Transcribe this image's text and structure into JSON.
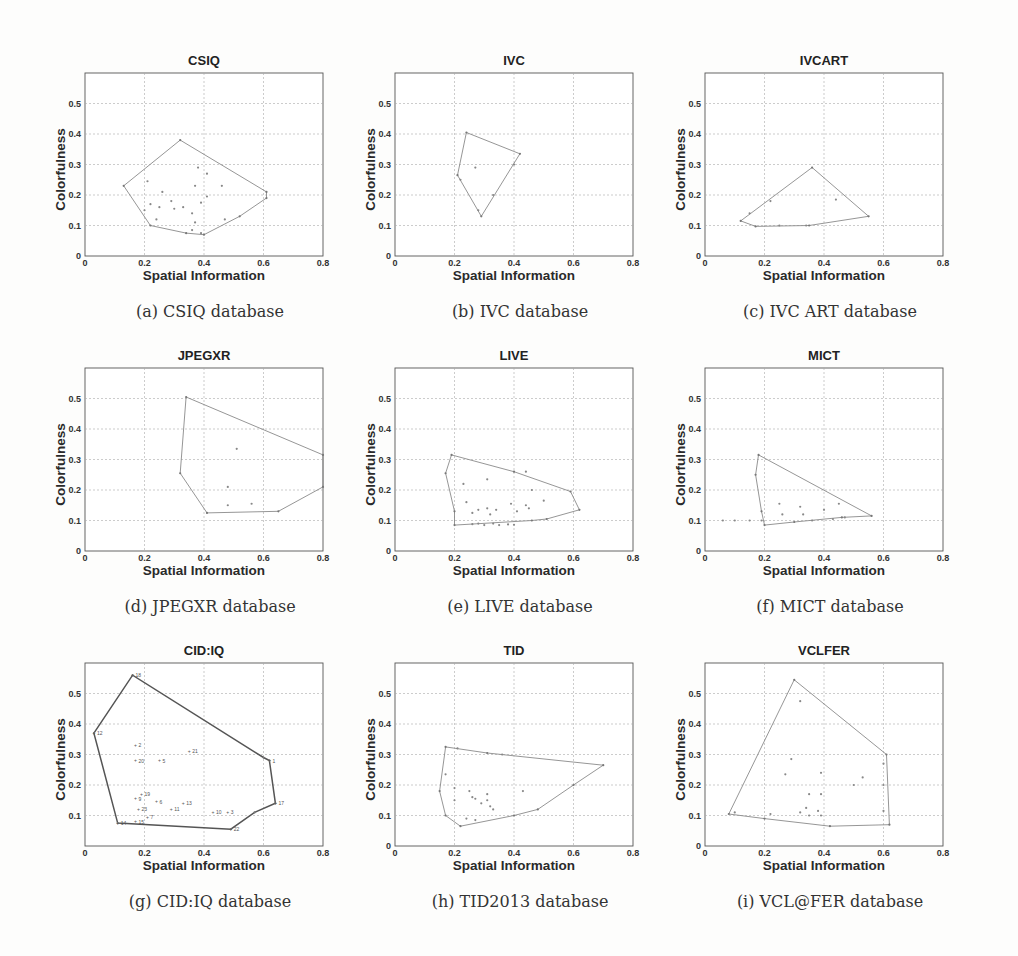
{
  "figure": {
    "panels": [
      {
        "id": "a",
        "caption": "(a)  CSIQ database"
      },
      {
        "id": "b",
        "caption": "(b)  IVC database"
      },
      {
        "id": "c",
        "caption": "(c)  IVC ART database"
      },
      {
        "id": "d",
        "caption": "(d)  JPEGXR database"
      },
      {
        "id": "e",
        "caption": "(e)  LIVE database"
      },
      {
        "id": "f",
        "caption": "(f)  MICT database"
      },
      {
        "id": "g",
        "caption": "(g)  CID:IQ database"
      },
      {
        "id": "h",
        "caption": "(h)  TID2013 database"
      },
      {
        "id": "i",
        "caption": "(i)  VCL@FER database"
      }
    ]
  },
  "chart_data": [
    {
      "type": "scatter",
      "title": "CSIQ",
      "xlabel": "Spatial Information",
      "ylabel": "Colorfulness",
      "xlim": [
        0,
        0.8
      ],
      "ylim": [
        0,
        0.6
      ],
      "xticks": [
        0,
        0.2,
        0.4,
        0.6,
        0.8
      ],
      "yticks": [
        0,
        0.1,
        0.2,
        0.3,
        0.4,
        0.5
      ],
      "grid": true,
      "hull": [
        [
          0.13,
          0.23
        ],
        [
          0.32,
          0.38
        ],
        [
          0.61,
          0.21
        ],
        [
          0.61,
          0.19
        ],
        [
          0.52,
          0.13
        ],
        [
          0.4,
          0.07
        ],
        [
          0.34,
          0.075
        ],
        [
          0.22,
          0.1
        ]
      ],
      "points": [
        [
          0.21,
          0.245
        ],
        [
          0.2,
          0.15
        ],
        [
          0.22,
          0.17
        ],
        [
          0.24,
          0.12
        ],
        [
          0.25,
          0.16
        ],
        [
          0.26,
          0.21
        ],
        [
          0.29,
          0.18
        ],
        [
          0.3,
          0.155
        ],
        [
          0.33,
          0.16
        ],
        [
          0.36,
          0.14
        ],
        [
          0.37,
          0.23
        ],
        [
          0.37,
          0.11
        ],
        [
          0.38,
          0.29
        ],
        [
          0.39,
          0.175
        ],
        [
          0.41,
          0.195
        ],
        [
          0.41,
          0.27
        ],
        [
          0.46,
          0.23
        ],
        [
          0.47,
          0.12
        ],
        [
          0.36,
          0.085
        ],
        [
          0.39,
          0.075
        ]
      ],
      "labels": []
    },
    {
      "type": "scatter",
      "title": "IVC",
      "xlabel": "Spatial Information",
      "ylabel": "Colorfulness",
      "xlim": [
        0,
        0.8
      ],
      "ylim": [
        0,
        0.6
      ],
      "xticks": [
        0,
        0.2,
        0.4,
        0.6,
        0.8
      ],
      "yticks": [
        0,
        0.1,
        0.2,
        0.3,
        0.4,
        0.5
      ],
      "grid": true,
      "hull": [
        [
          0.21,
          0.265
        ],
        [
          0.24,
          0.405
        ],
        [
          0.42,
          0.335
        ],
        [
          0.29,
          0.13
        ]
      ],
      "points": [
        [
          0.22,
          0.25
        ],
        [
          0.27,
          0.29
        ],
        [
          0.33,
          0.2
        ],
        [
          0.4,
          0.3
        ],
        [
          0.28,
          0.15
        ]
      ],
      "labels": []
    },
    {
      "type": "scatter",
      "title": "IVCART",
      "xlabel": "Spatial Information",
      "ylabel": "Colorfulness",
      "xlim": [
        0,
        0.8
      ],
      "ylim": [
        0,
        0.6
      ],
      "xticks": [
        0,
        0.2,
        0.4,
        0.6,
        0.8
      ],
      "yticks": [
        0,
        0.1,
        0.2,
        0.3,
        0.4,
        0.5
      ],
      "grid": true,
      "hull": [
        [
          0.12,
          0.115
        ],
        [
          0.36,
          0.29
        ],
        [
          0.55,
          0.13
        ],
        [
          0.35,
          0.1
        ],
        [
          0.17,
          0.097
        ]
      ],
      "points": [
        [
          0.15,
          0.14
        ],
        [
          0.22,
          0.18
        ],
        [
          0.44,
          0.185
        ],
        [
          0.34,
          0.1
        ],
        [
          0.25,
          0.1
        ]
      ],
      "labels": []
    },
    {
      "type": "scatter",
      "title": "JPEGXR",
      "xlabel": "Spatial Information",
      "ylabel": "Colorfulness",
      "xlim": [
        0,
        0.8
      ],
      "ylim": [
        0,
        0.6
      ],
      "xticks": [
        0,
        0.2,
        0.4,
        0.6,
        0.8
      ],
      "yticks": [
        0,
        0.1,
        0.2,
        0.3,
        0.4,
        0.5
      ],
      "grid": true,
      "hull": [
        [
          0.32,
          0.255
        ],
        [
          0.34,
          0.505
        ],
        [
          0.8,
          0.315
        ],
        [
          0.8,
          0.21
        ],
        [
          0.65,
          0.13
        ],
        [
          0.41,
          0.125
        ]
      ],
      "points": [
        [
          0.51,
          0.335
        ],
        [
          0.48,
          0.21
        ],
        [
          0.48,
          0.15
        ],
        [
          0.56,
          0.155
        ]
      ],
      "labels": []
    },
    {
      "type": "scatter",
      "title": "LIVE",
      "xlabel": "Spatial Information",
      "ylabel": "Colorfulness",
      "xlim": [
        0,
        0.8
      ],
      "ylim": [
        0,
        0.6
      ],
      "xticks": [
        0,
        0.2,
        0.4,
        0.6,
        0.8
      ],
      "yticks": [
        0,
        0.1,
        0.2,
        0.3,
        0.4,
        0.5
      ],
      "grid": true,
      "hull": [
        [
          0.17,
          0.255
        ],
        [
          0.19,
          0.315
        ],
        [
          0.4,
          0.26
        ],
        [
          0.59,
          0.195
        ],
        [
          0.62,
          0.135
        ],
        [
          0.51,
          0.105
        ],
        [
          0.46,
          0.1
        ],
        [
          0.2,
          0.085
        ],
        [
          0.2,
          0.13
        ]
      ],
      "points": [
        [
          0.23,
          0.22
        ],
        [
          0.31,
          0.235
        ],
        [
          0.24,
          0.16
        ],
        [
          0.26,
          0.125
        ],
        [
          0.28,
          0.135
        ],
        [
          0.31,
          0.14
        ],
        [
          0.32,
          0.12
        ],
        [
          0.34,
          0.135
        ],
        [
          0.39,
          0.155
        ],
        [
          0.41,
          0.13
        ],
        [
          0.44,
          0.15
        ],
        [
          0.45,
          0.14
        ],
        [
          0.46,
          0.2
        ],
        [
          0.5,
          0.165
        ],
        [
          0.28,
          0.09
        ],
        [
          0.3,
          0.085
        ],
        [
          0.33,
          0.09
        ],
        [
          0.35,
          0.085
        ],
        [
          0.38,
          0.087
        ],
        [
          0.4,
          0.086
        ],
        [
          0.26,
          0.088
        ],
        [
          0.44,
          0.26
        ]
      ],
      "labels": []
    },
    {
      "type": "scatter",
      "title": "MICT",
      "xlabel": "Spatial Information",
      "ylabel": "Colorfulness",
      "xlim": [
        0,
        0.8
      ],
      "ylim": [
        0,
        0.6
      ],
      "xticks": [
        0,
        0.2,
        0.4,
        0.6,
        0.8
      ],
      "yticks": [
        0,
        0.1,
        0.2,
        0.3,
        0.4,
        0.5
      ],
      "grid": true,
      "hull": [
        [
          0.17,
          0.25
        ],
        [
          0.18,
          0.315
        ],
        [
          0.56,
          0.115
        ],
        [
          0.46,
          0.11
        ],
        [
          0.3,
          0.095
        ],
        [
          0.2,
          0.085
        ],
        [
          0.19,
          0.13
        ]
      ],
      "points": [
        [
          0.25,
          0.155
        ],
        [
          0.26,
          0.12
        ],
        [
          0.32,
          0.145
        ],
        [
          0.33,
          0.12
        ],
        [
          0.4,
          0.135
        ],
        [
          0.45,
          0.155
        ],
        [
          0.47,
          0.11
        ],
        [
          0.43,
          0.105
        ],
        [
          0.36,
          0.1
        ],
        [
          0.19,
          0.1
        ],
        [
          0.15,
          0.1
        ],
        [
          0.1,
          0.1
        ],
        [
          0.06,
          0.1
        ]
      ],
      "labels": []
    },
    {
      "type": "scatter",
      "title": "CID:IQ",
      "xlabel": "Spatial Information",
      "ylabel": "Colorfulness",
      "xlim": [
        0,
        0.8
      ],
      "ylim": [
        0,
        0.6
      ],
      "xticks": [
        0,
        0.2,
        0.4,
        0.6,
        0.8
      ],
      "yticks": [
        0.1,
        0.2,
        0.3,
        0.4,
        0.5
      ],
      "grid": true,
      "hull": [
        [
          0.03,
          0.37
        ],
        [
          0.16,
          0.56
        ],
        [
          0.6,
          0.29
        ],
        [
          0.62,
          0.28
        ],
        [
          0.64,
          0.14
        ],
        [
          0.57,
          0.11
        ],
        [
          0.49,
          0.055
        ],
        [
          0.11,
          0.075
        ]
      ],
      "points": [],
      "labels": [
        {
          "x": 0.16,
          "y": 0.56,
          "t": "18"
        },
        {
          "x": 0.03,
          "y": 0.37,
          "t": "12"
        },
        {
          "x": 0.17,
          "y": 0.33,
          "t": "2"
        },
        {
          "x": 0.35,
          "y": 0.31,
          "t": "21"
        },
        {
          "x": 0.17,
          "y": 0.28,
          "t": "20"
        },
        {
          "x": 0.25,
          "y": 0.28,
          "t": "5"
        },
        {
          "x": 0.62,
          "y": 0.28,
          "t": "1"
        },
        {
          "x": 0.19,
          "y": 0.17,
          "t": "19"
        },
        {
          "x": 0.17,
          "y": 0.155,
          "t": "9"
        },
        {
          "x": 0.24,
          "y": 0.145,
          "t": "6"
        },
        {
          "x": 0.33,
          "y": 0.14,
          "t": "13"
        },
        {
          "x": 0.29,
          "y": 0.12,
          "t": "11"
        },
        {
          "x": 0.18,
          "y": 0.12,
          "t": "23"
        },
        {
          "x": 0.43,
          "y": 0.11,
          "t": "10"
        },
        {
          "x": 0.48,
          "y": 0.11,
          "t": "3"
        },
        {
          "x": 0.64,
          "y": 0.14,
          "t": "17"
        },
        {
          "x": 0.21,
          "y": 0.095,
          "t": "7"
        },
        {
          "x": 0.11,
          "y": 0.075,
          "t": "14"
        },
        {
          "x": 0.17,
          "y": 0.08,
          "t": "15"
        },
        {
          "x": 0.49,
          "y": 0.055,
          "t": "22"
        }
      ]
    },
    {
      "type": "scatter",
      "title": "TID",
      "xlabel": "Spatial Information",
      "ylabel": "Colorfulness",
      "xlim": [
        0,
        0.8
      ],
      "ylim": [
        0,
        0.6
      ],
      "xticks": [
        0,
        0.2,
        0.4,
        0.6,
        0.8
      ],
      "yticks": [
        0,
        0.1,
        0.2,
        0.3,
        0.4,
        0.5
      ],
      "grid": true,
      "hull": [
        [
          0.15,
          0.18
        ],
        [
          0.17,
          0.325
        ],
        [
          0.31,
          0.305
        ],
        [
          0.7,
          0.265
        ],
        [
          0.6,
          0.2
        ],
        [
          0.48,
          0.12
        ],
        [
          0.4,
          0.1
        ],
        [
          0.22,
          0.065
        ],
        [
          0.17,
          0.1
        ]
      ],
      "points": [
        [
          0.17,
          0.235
        ],
        [
          0.2,
          0.19
        ],
        [
          0.2,
          0.15
        ],
        [
          0.25,
          0.18
        ],
        [
          0.26,
          0.16
        ],
        [
          0.27,
          0.155
        ],
        [
          0.29,
          0.14
        ],
        [
          0.31,
          0.17
        ],
        [
          0.32,
          0.13
        ],
        [
          0.33,
          0.12
        ],
        [
          0.43,
          0.18
        ],
        [
          0.24,
          0.09
        ],
        [
          0.27,
          0.085
        ],
        [
          0.31,
          0.15
        ],
        [
          0.21,
          0.32
        ],
        [
          0.36,
          0.3
        ]
      ],
      "labels": []
    },
    {
      "type": "scatter",
      "title": "VCLFER",
      "xlabel": "Spatial Information",
      "ylabel": "Colorfulness",
      "xlim": [
        0,
        0.8
      ],
      "ylim": [
        0,
        0.6
      ],
      "xticks": [
        0,
        0.2,
        0.4,
        0.6,
        0.8
      ],
      "yticks": [
        0,
        0.1,
        0.2,
        0.3,
        0.4,
        0.5
      ],
      "grid": true,
      "hull": [
        [
          0.08,
          0.105
        ],
        [
          0.3,
          0.545
        ],
        [
          0.61,
          0.3
        ],
        [
          0.62,
          0.07
        ],
        [
          0.42,
          0.065
        ],
        [
          0.2,
          0.09
        ]
      ],
      "points": [
        [
          0.32,
          0.475
        ],
        [
          0.29,
          0.285
        ],
        [
          0.27,
          0.235
        ],
        [
          0.39,
          0.24
        ],
        [
          0.5,
          0.2
        ],
        [
          0.53,
          0.225
        ],
        [
          0.6,
          0.2
        ],
        [
          0.35,
          0.17
        ],
        [
          0.39,
          0.17
        ],
        [
          0.34,
          0.125
        ],
        [
          0.38,
          0.115
        ],
        [
          0.32,
          0.11
        ],
        [
          0.35,
          0.1
        ],
        [
          0.39,
          0.1
        ],
        [
          0.1,
          0.11
        ],
        [
          0.22,
          0.105
        ],
        [
          0.6,
          0.27
        ],
        [
          0.6,
          0.115
        ]
      ],
      "labels": []
    }
  ]
}
